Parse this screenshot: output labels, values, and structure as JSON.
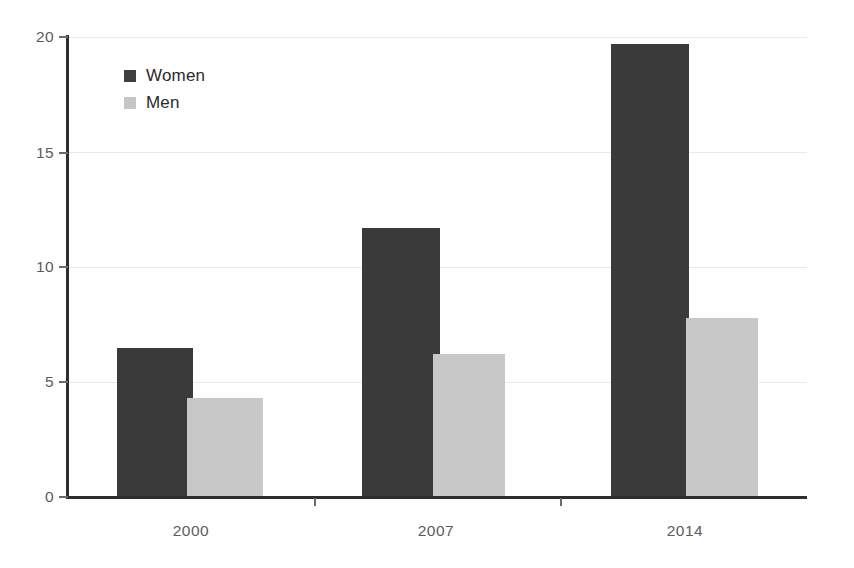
{
  "chart_data": {
    "type": "bar",
    "title": "",
    "subtitle": "",
    "xlabel": "",
    "ylabel": "",
    "categories": [
      "2000",
      "2007",
      "2014"
    ],
    "series": [
      {
        "name": "Women",
        "color": "#3a3a3a",
        "values": [
          6.5,
          11.7,
          19.7
        ]
      },
      {
        "name": "Men",
        "color": "#c8c8c8",
        "values": [
          4.3,
          6.2,
          7.8
        ]
      }
    ],
    "ylim": [
      0,
      20
    ],
    "yticks": [
      0,
      5,
      10,
      15,
      20
    ],
    "ytick_labels": [
      "0",
      "5",
      "10",
      "15",
      "20"
    ],
    "grid": true,
    "grid_axis": "y",
    "legend_position": "top-left",
    "bar_group_order": [
      "Women",
      "Men"
    ]
  },
  "legend": {
    "items": [
      {
        "label": "Women",
        "swatch": "women-swatch"
      },
      {
        "label": "Men",
        "swatch": "men-swatch"
      }
    ]
  },
  "axes": {
    "y_tick_labels": [
      "20",
      "15",
      "10",
      "5",
      "0"
    ],
    "x_tick_labels": [
      "2000",
      "2007",
      "2014"
    ]
  },
  "colors": {
    "women": "#3a3a3a",
    "men": "#c8c8c8",
    "axis": "#2e2e2e",
    "gridline": "#e9e9ea",
    "tick_text": "#5c5c5c",
    "legend_text": "#2b2b2b",
    "background": "#ffffff"
  }
}
